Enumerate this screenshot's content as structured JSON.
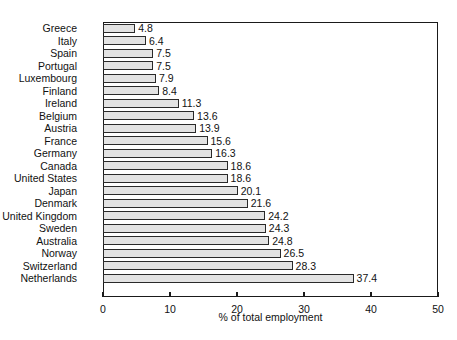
{
  "chart_data": {
    "type": "bar",
    "orientation": "horizontal",
    "title": "",
    "xlabel": "% of total employment",
    "ylabel": "",
    "xlim": [
      0,
      50
    ],
    "xticks": [
      0,
      10,
      20,
      30,
      40,
      50
    ],
    "xtick_labels": [
      "0",
      "10",
      "20",
      "30",
      "40",
      "50"
    ],
    "grid": false,
    "legend": false,
    "bar_fill_color": "#e3e3e3",
    "bar_edge_color": "#2a2a2a",
    "background_color": "#ffffff",
    "categories": [
      "Greece",
      "Italy",
      "Spain",
      "Portugal",
      "Luxembourg",
      "Finland",
      "Ireland",
      "Belgium",
      "Austria",
      "France",
      "Germany",
      "Canada",
      "United States",
      "Japan",
      "Denmark",
      "United Kingdom",
      "Sweden",
      "Australia",
      "Norway",
      "Switzerland",
      "Netherlands"
    ],
    "values": [
      4.8,
      6.4,
      7.5,
      7.5,
      7.9,
      8.4,
      11.3,
      13.6,
      13.9,
      15.6,
      16.3,
      18.6,
      18.6,
      20.1,
      21.6,
      24.2,
      24.3,
      24.8,
      26.5,
      28.3,
      37.4
    ],
    "value_labels": [
      "4.8",
      "6.4",
      "7.5",
      "7.5",
      "7.9",
      "8.4",
      "11.3",
      "13.6",
      "13.9",
      "15.6",
      "16.3",
      "18.6",
      "18.6",
      "20.1",
      "21.6",
      "24.2",
      "24.3",
      "24.8",
      "26.5",
      "28.3",
      "37.4"
    ]
  },
  "caption": ""
}
